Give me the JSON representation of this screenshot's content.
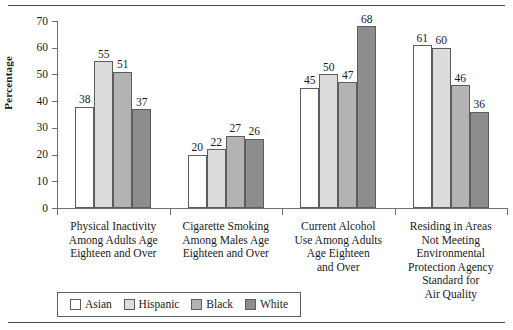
{
  "chart_data": {
    "type": "bar",
    "title": "",
    "xlabel": "",
    "ylabel": "Percentage",
    "ylim": [
      0,
      70
    ],
    "yticks": [
      0,
      10,
      20,
      30,
      40,
      50,
      60,
      70
    ],
    "grid": false,
    "legend_position": "bottom-left",
    "categories": [
      "Physical Inactivity Among Adults Age Eighteen and Over",
      "Cigarette Smoking Among Males Age Eighteen and Over",
      "Current Alcohol Use Among Adults Age Eighteen and Over",
      "Residing in Areas Not Meeting Environmental Protection Agency Standard for Air Quality"
    ],
    "category_caption_lines": [
      [
        "Physical Inactivity",
        "Among Adults Age",
        "Eighteen and Over"
      ],
      [
        "Cigarette Smoking",
        "Among Males Age",
        "Eighteen and Over"
      ],
      [
        "Current Alcohol",
        "Use Among Adults",
        "Age Eighteen",
        "and Over"
      ],
      [
        "Residing in Areas",
        "Not Meeting",
        "Environmental",
        "Protection Agency",
        "Standard for",
        "Air Quality"
      ]
    ],
    "series": [
      {
        "name": "Asian",
        "color": "#ffffff",
        "values": [
          38,
          20,
          45,
          61
        ]
      },
      {
        "name": "Hispanic",
        "color": "#dcdcdc",
        "values": [
          55,
          22,
          50,
          60
        ]
      },
      {
        "name": "Black",
        "color": "#b3b3b3",
        "values": [
          51,
          27,
          47,
          46
        ]
      },
      {
        "name": "White",
        "color": "#8d8d8d",
        "values": [
          37,
          26,
          68,
          36
        ]
      }
    ]
  }
}
